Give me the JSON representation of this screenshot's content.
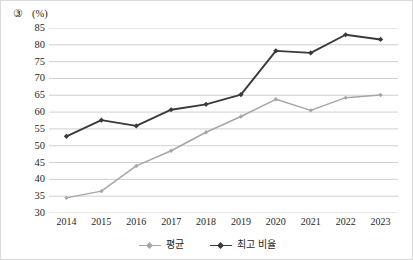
{
  "figure": {
    "item_number": "③",
    "unit_label": "(%)"
  },
  "legend": {
    "position": "bottom-center",
    "items": [
      {
        "label": "평균",
        "color": "#a6a6a6",
        "marker": "diamond-marker"
      },
      {
        "label": "최고 비율",
        "color": "#3a3a3a",
        "marker": "diamond-marker"
      }
    ]
  },
  "chart_data": {
    "type": "line",
    "title": "",
    "subtitle": "",
    "xlabel": "",
    "ylabel": "(%)",
    "categories": [
      "2014",
      "2015",
      "2016",
      "2017",
      "2018",
      "2019",
      "2020",
      "2021",
      "2022",
      "2023"
    ],
    "ylim": [
      30,
      85
    ],
    "ytick_step": 5,
    "yticks": [
      85,
      80,
      75,
      70,
      65,
      60,
      55,
      50,
      45,
      40,
      35,
      30
    ],
    "grid": "horizontal",
    "legend_position": "bottom-center",
    "series": [
      {
        "name": "평균",
        "color": "#a6a6a6",
        "values": [
          34.5,
          36.5,
          44.0,
          48.5,
          54.0,
          58.7,
          63.8,
          60.5,
          64.3,
          65.1
        ]
      },
      {
        "name": "최고 비율",
        "color": "#3a3a3a",
        "values": [
          52.8,
          57.6,
          55.9,
          60.7,
          62.3,
          65.2,
          78.2,
          77.6,
          83.0,
          81.6
        ]
      }
    ]
  }
}
